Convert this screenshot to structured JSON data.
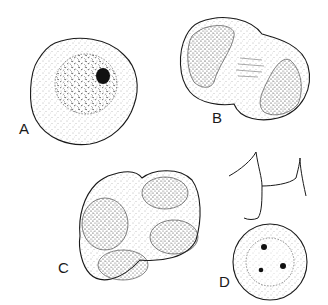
{
  "figure": {
    "background": "#ffffff",
    "ink_color": "#1a1a1a",
    "stipple_color": "#555555",
    "panels": [
      {
        "label": "A",
        "content": "single cell with large nucleus and dark nucleolus"
      },
      {
        "label": "B",
        "content": "dyad: two-lobed cell with two nuclei"
      },
      {
        "label": "C",
        "content": "tetrad: four-lobed cell with four nuclei"
      },
      {
        "label": "D",
        "content": "round cell with nucleus containing three dark bodies, beneath a triradiate (three-armed) structure"
      }
    ]
  }
}
